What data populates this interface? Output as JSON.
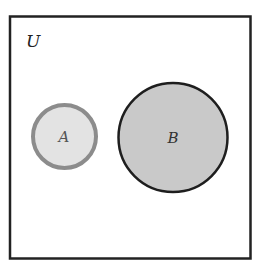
{
  "diagram": {
    "type": "venn",
    "universe": {
      "label": "U",
      "stroke": "#222222",
      "fill": "#ffffff"
    },
    "sets": [
      {
        "label": "A",
        "fill": "#e3e3e3",
        "stroke": "#8c8c8c"
      },
      {
        "label": "B",
        "fill": "#c9c9c9",
        "stroke": "#1e1e1e"
      }
    ],
    "relationship": "disjoint"
  }
}
